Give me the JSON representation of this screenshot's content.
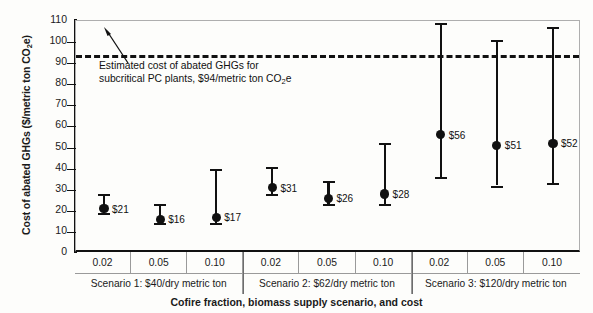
{
  "chart_data": {
    "type": "scatter",
    "title": "",
    "xlabel": "Cofire fraction, biomass supply scenario, and cost",
    "ylabel": "Cost of abated GHGs ($/metric ton CO2e)",
    "ylabel_main": "Cost of abated GHGs ($/metric ton CO",
    "ylabel_sub": "2",
    "ylabel_tail": "e)",
    "ylim": [
      0,
      110
    ],
    "ytick_step": 10,
    "yticks": [
      "110",
      "100",
      "90",
      "80",
      "70",
      "60",
      "50",
      "40",
      "30",
      "20",
      "10",
      "0"
    ],
    "grid": false,
    "legend": "none",
    "marker_color": "#111111",
    "benchmark": {
      "value": 94,
      "style": "dashed",
      "color": "#111111",
      "annotation_line1": "Estimated cost of abated GHGs for",
      "annotation_line2_pre": "subcritical PC plants, $94/metric ton CO",
      "annotation_line2_sub": "2",
      "annotation_line2_post": "e"
    },
    "categories": [
      "0.02",
      "0.05",
      "0.10",
      "0.02",
      "0.05",
      "0.10",
      "0.02",
      "0.05",
      "0.10"
    ],
    "values": [
      21,
      16,
      17,
      31,
      26,
      28,
      56,
      51,
      52
    ],
    "labels": [
      "$21",
      "$16",
      "$17",
      "$31",
      "$26",
      "$28",
      "$56",
      "$51",
      "$52"
    ],
    "errors_low": [
      19,
      14,
      14,
      28,
      23,
      23,
      36,
      32,
      33
    ],
    "errors_high": [
      28,
      23,
      40,
      41,
      34,
      52,
      109,
      101,
      107
    ],
    "groups": [
      {
        "label": "Scenario 1: $40/dry metric ton",
        "fractions": [
          "0.02",
          "0.05",
          "0.10"
        ]
      },
      {
        "label": "Scenario 2: $62/dry metric ton",
        "fractions": [
          "0.02",
          "0.05",
          "0.10"
        ]
      },
      {
        "label": "Scenario 3: $120/dry metric ton",
        "fractions": [
          "0.02",
          "0.05",
          "0.10"
        ]
      }
    ]
  }
}
